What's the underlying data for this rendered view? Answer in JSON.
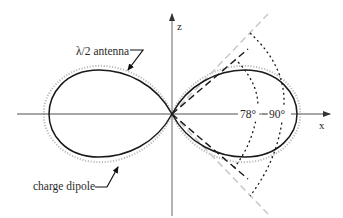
{
  "diagram": {
    "axes": {
      "x_label": "x",
      "z_label": "z"
    },
    "labels": {
      "antenna": "λ/2 antenna",
      "dipole": "charge dipole",
      "angle_inner": "78°",
      "angle_outer": "90°"
    },
    "series": [
      {
        "name": "λ/2 antenna",
        "style": "solid",
        "color": "#1a1a1a"
      },
      {
        "name": "charge dipole",
        "style": "dotted",
        "color": "#b8b8b8"
      }
    ],
    "guides": [
      {
        "name": "beamwidth 78°",
        "style": "dashed",
        "color": "#1a1a1a"
      },
      {
        "name": "beamwidth 90°",
        "style": "dashed",
        "color": "#c4c4c4"
      },
      {
        "name": "arc 78°",
        "style": "dotted",
        "color": "#1a1a1a"
      },
      {
        "name": "arc 90°",
        "style": "dotted",
        "color": "#1a1a1a"
      }
    ],
    "colors": {
      "axis": "#8a8a8a",
      "curve": "#1a1a1a",
      "dipole": "#b5b5b5",
      "guide_light": "#c8c8c8"
    }
  }
}
